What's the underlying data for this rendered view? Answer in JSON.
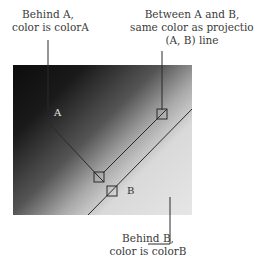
{
  "labels": {
    "behind_a_line1": "Behind A,",
    "behind_a_line2": "color is colorA",
    "between_line1": "Between A and B,",
    "between_line2": "same color as projection on the",
    "between_line3": "(A, B) line",
    "behind_b_line1": "Behind B,",
    "behind_b_line2": "color is colorB"
  },
  "points": {
    "a": "A",
    "b": "B"
  },
  "colors": {
    "colorA": "#0c0c0c",
    "colorB": "#e6e6e6",
    "line": "#2a2a2a"
  }
}
